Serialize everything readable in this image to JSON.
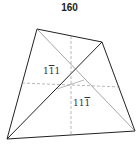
{
  "title": "160",
  "labels": [
    {
      "id": "face1",
      "parts": [
        "1",
        "1",
        "1"
      ],
      "overbar": [
        false,
        true,
        false
      ],
      "x": 43,
      "y": 66
    },
    {
      "id": "face2",
      "parts": [
        "1",
        "1",
        "1"
      ],
      "overbar": [
        false,
        false,
        true
      ],
      "x": 73,
      "y": 98
    }
  ],
  "colors": {
    "line": "#222222",
    "thin": "#777777"
  }
}
